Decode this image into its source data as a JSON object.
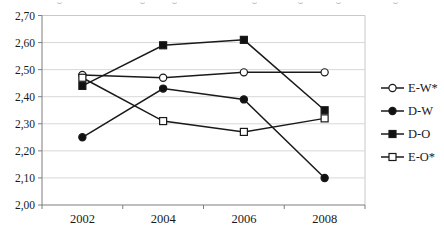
{
  "chart_data": {
    "type": "line",
    "categories": [
      "2002",
      "2004",
      "2006",
      "2008"
    ],
    "series": [
      {
        "name": "E-W*",
        "marker": "circle-open",
        "values": [
          2.48,
          2.47,
          2.49,
          2.49
        ]
      },
      {
        "name": "D-W",
        "marker": "circle-filled",
        "values": [
          2.25,
          2.43,
          2.39,
          2.1
        ]
      },
      {
        "name": "D-O",
        "marker": "square-filled",
        "values": [
          2.44,
          2.59,
          2.61,
          2.35
        ]
      },
      {
        "name": "E-O*",
        "marker": "square-open",
        "values": [
          2.47,
          2.31,
          2.27,
          2.32
        ]
      }
    ],
    "title": "",
    "xlabel": "",
    "ylabel": "",
    "y_axis": {
      "min": 2.0,
      "max": 2.7,
      "tick_step": 0.1,
      "tick_labels": [
        "2,00",
        "2,10",
        "2,20",
        "2,30",
        "2,40",
        "2,50",
        "2,60",
        "2,70"
      ]
    },
    "grid": true,
    "legend_position": "right",
    "colors": {
      "series_line": "#1a1a1a",
      "marker_fill": "#111111",
      "marker_open_fill": "#ffffff",
      "gridline": "#d7d7d7",
      "frame": "#c9c9c9",
      "axis": "#7f7f7f",
      "text": "#1a1a1a"
    }
  }
}
